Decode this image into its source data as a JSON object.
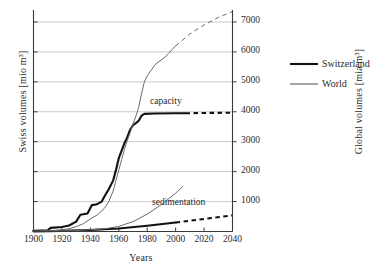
{
  "chart_data": {
    "type": "line",
    "title": "",
    "xlabel": "Years",
    "ylabel_left": "Swiss volumes  [mio m³]",
    "ylabel_right": "Global volumes [mia m³]",
    "xlim": [
      1900,
      2040
    ],
    "xticks": [
      1900,
      1920,
      1940,
      1960,
      1980,
      2000,
      2020,
      2040
    ],
    "xticklabels": [
      "1900",
      "1920",
      "1940",
      "1960",
      "1980",
      "2000",
      "2020",
      "2040"
    ],
    "ylim_right": [
      0,
      7400
    ],
    "yticks_right": [
      1000,
      2000,
      3000,
      4000,
      5000,
      6000,
      7000
    ],
    "yticklabels_right": [
      "1000",
      "2000",
      "3000",
      "4000",
      "5000",
      "6000",
      "7000"
    ],
    "grid": true,
    "legend_position": "right-outside",
    "annotations": [
      {
        "text": "capacity",
        "x": 1985,
        "y": 4350
      },
      {
        "text": "sedimentation",
        "x": 1988,
        "y": 850
      }
    ],
    "series": [
      {
        "name": "Switzerland",
        "legend": "Switzerland",
        "color": "#111111",
        "width": 2.1,
        "curves": [
          {
            "label": "capacity",
            "style": "solid-then-dashed",
            "dash_from": 2007,
            "points": [
              [
                1900,
                20
              ],
              [
                1910,
                40
              ],
              [
                1912,
                120
              ],
              [
                1920,
                150
              ],
              [
                1925,
                200
              ],
              [
                1930,
                330
              ],
              [
                1933,
                560
              ],
              [
                1938,
                600
              ],
              [
                1941,
                880
              ],
              [
                1944,
                900
              ],
              [
                1948,
                1000
              ],
              [
                1950,
                1180
              ],
              [
                1953,
                1420
              ],
              [
                1956,
                1700
              ],
              [
                1958,
                2050
              ],
              [
                1960,
                2450
              ],
              [
                1962,
                2700
              ],
              [
                1964,
                2950
              ],
              [
                1966,
                3150
              ],
              [
                1968,
                3400
              ],
              [
                1970,
                3550
              ],
              [
                1972,
                3620
              ],
              [
                1974,
                3700
              ],
              [
                1976,
                3870
              ],
              [
                1978,
                3930
              ],
              [
                1985,
                3940
              ],
              [
                2000,
                3950
              ],
              [
                2007,
                3950
              ],
              [
                2020,
                3960
              ],
              [
                2040,
                3970
              ]
            ]
          },
          {
            "label": "sedimentation",
            "style": "solid-then-dashed",
            "dash_from": 2000,
            "points": [
              [
                1900,
                5
              ],
              [
                1920,
                20
              ],
              [
                1940,
                50
              ],
              [
                1960,
                100
              ],
              [
                1980,
                190
              ],
              [
                2000,
                300
              ],
              [
                2020,
                420
              ],
              [
                2040,
                540
              ]
            ]
          }
        ]
      },
      {
        "name": "World",
        "legend": "World",
        "color": "#6b6b6b",
        "width": 1.0,
        "curves": [
          {
            "label": "capacity",
            "style": "solid-then-dashed",
            "dash_from": 2000,
            "points": [
              [
                1900,
                10
              ],
              [
                1915,
                30
              ],
              [
                1925,
                90
              ],
              [
                1930,
                160
              ],
              [
                1935,
                260
              ],
              [
                1940,
                420
              ],
              [
                1945,
                560
              ],
              [
                1950,
                780
              ],
              [
                1953,
                1000
              ],
              [
                1956,
                1350
              ],
              [
                1958,
                1700
              ],
              [
                1960,
                2050
              ],
              [
                1962,
                2400
              ],
              [
                1964,
                2750
              ],
              [
                1966,
                3050
              ],
              [
                1968,
                3300
              ],
              [
                1970,
                3600
              ],
              [
                1972,
                3850
              ],
              [
                1974,
                4150
              ],
              [
                1976,
                4600
              ],
              [
                1978,
                5000
              ],
              [
                1980,
                5200
              ],
              [
                1983,
                5400
              ],
              [
                1986,
                5600
              ],
              [
                1989,
                5700
              ],
              [
                1992,
                5800
              ],
              [
                1995,
                5950
              ],
              [
                1998,
                6100
              ],
              [
                2000,
                6200
              ],
              [
                2010,
                6600
              ],
              [
                2020,
                6900
              ],
              [
                2030,
                7150
              ],
              [
                2040,
                7350
              ]
            ]
          },
          {
            "label": "sedimentation",
            "style": "solid",
            "points": [
              [
                1900,
                5
              ],
              [
                1930,
                30
              ],
              [
                1950,
                90
              ],
              [
                1960,
                170
              ],
              [
                1970,
                330
              ],
              [
                1980,
                580
              ],
              [
                1990,
                900
              ],
              [
                2000,
                1280
              ],
              [
                2005,
                1500
              ]
            ]
          }
        ]
      }
    ]
  },
  "legend": {
    "items": [
      {
        "label": "Switzerland",
        "color": "#111111"
      },
      {
        "label": "World",
        "color": "#6b6b6b"
      }
    ]
  }
}
